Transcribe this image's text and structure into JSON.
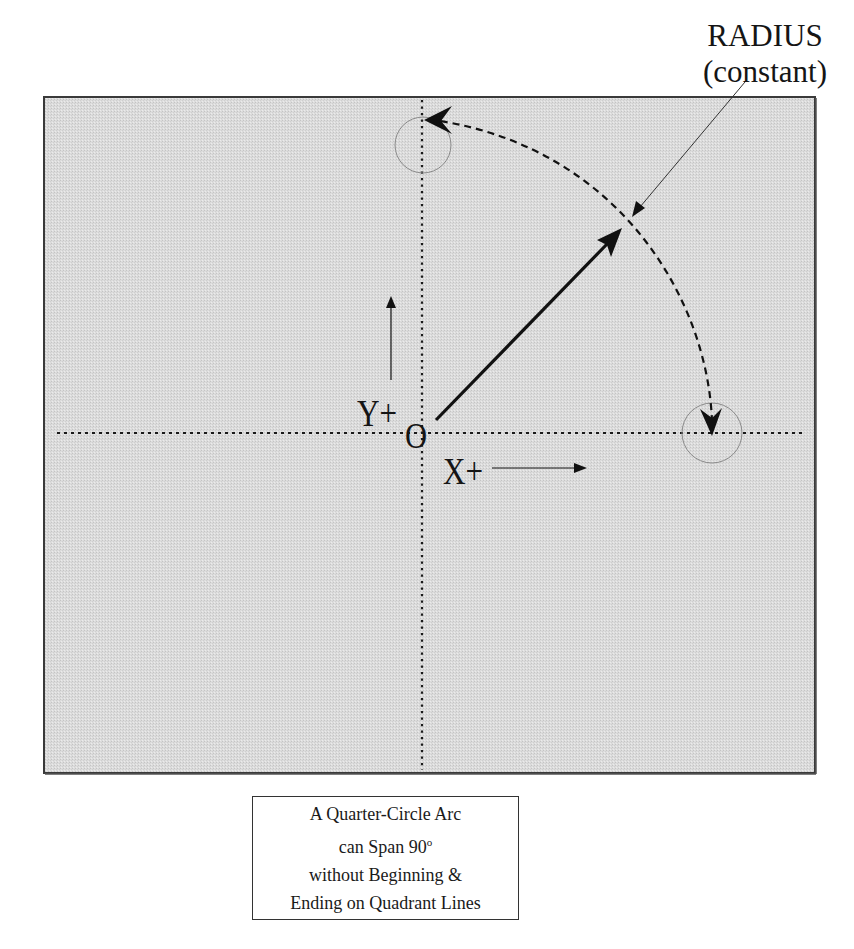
{
  "diagram": {
    "radius_label": {
      "line1": "RADIUS",
      "line2": "(constant)"
    },
    "axes": {
      "y_label": "Y+",
      "x_label": "X+",
      "origin_label": "O"
    },
    "caption": {
      "line1": "A Quarter-Circle Arc",
      "line2_prefix": "can Span 90",
      "line2_superscript": "o",
      "line3": "without Beginning &",
      "line4": "Ending on Quadrant Lines"
    },
    "colors": {
      "frame_fill": "#d9d9d9",
      "frame_border": "#3a3a3a",
      "line_color": "#111111",
      "highlight_circle": "#8a8a8a"
    },
    "geometry": {
      "frame": {
        "x": 44,
        "y": 97,
        "width": 771,
        "height": 676
      },
      "origin": {
        "x": 422,
        "y": 433
      },
      "radius_vector_end": {
        "x": 622,
        "y": 228
      },
      "arc_start": {
        "x": 712,
        "y": 432
      },
      "arc_end": {
        "x": 426,
        "y": 120
      },
      "start_circle": {
        "cx": 712,
        "cy": 433,
        "r": 30
      },
      "end_circle": {
        "cx": 423,
        "cy": 145,
        "r": 28
      },
      "arc_span_degrees": 90
    }
  }
}
